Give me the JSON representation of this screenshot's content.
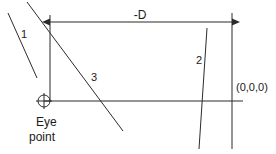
{
  "diagram": {
    "colors": {
      "stroke": "#2b2b2b",
      "text": "#1a1a1a",
      "background": "#ffffff"
    },
    "labels": {
      "dimension": "-D",
      "line_one": "1",
      "line_two": "2",
      "line_three": "3",
      "origin": "(0,0,0)",
      "eye_line_1": "Eye",
      "eye_line_2": "point"
    },
    "geometry": {
      "dimension_arrow": {
        "x1": 50,
        "x2": 232,
        "y": 22
      },
      "left_vertical": {
        "x": 50,
        "y1": 15,
        "y2": 100
      },
      "right_vertical": {
        "x": 232,
        "y1": 13,
        "y2": 149
      },
      "horizontal_axis": {
        "x1": 44,
        "x2": 243,
        "y": 101
      },
      "eye_point_marker": {
        "cx": 44,
        "cy": 101,
        "r": 6
      },
      "line_one_segment": {
        "x1": 8,
        "y1": 13,
        "x2": 37,
        "y2": 78
      },
      "line_three_segment": {
        "x1": 27,
        "y1": 2,
        "x2": 123,
        "y2": 131
      },
      "line_two_segment": {
        "x1": 207,
        "y1": 28,
        "x2": 199,
        "y2": 149
      }
    },
    "label_positions": {
      "dimension": {
        "x": 140,
        "y": 19
      },
      "line_one": {
        "x": 21,
        "y": 38
      },
      "line_two": {
        "x": 196,
        "y": 64
      },
      "line_three": {
        "x": 91,
        "y": 81
      },
      "origin": {
        "x": 236,
        "y": 91
      },
      "eye_line_1": {
        "x": 36,
        "y": 126
      },
      "eye_line_2": {
        "x": 29,
        "y": 141
      }
    }
  }
}
